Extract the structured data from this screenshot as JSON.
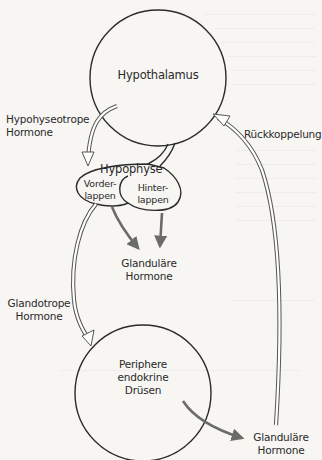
{
  "diagram": {
    "title": "",
    "nodes": {
      "hypothalamus": {
        "label": "Hypothalamus"
      },
      "hypophyse": {
        "label": "Hypophyse"
      },
      "vorderlappen": {
        "line1": "Vorder-",
        "line2": "lappen"
      },
      "hinterlappen": {
        "line1": "Hinter-",
        "line2": "lappen"
      },
      "periphere_druesen": {
        "line1": "Periphere",
        "line2": "endokrine",
        "line3": "Drüsen"
      }
    },
    "edge_labels": {
      "hypophyseotrope": {
        "line1": "Hypohyseotrope",
        "line2": "Hormone"
      },
      "rueckkoppelung": {
        "label": "Rückkoppelung"
      },
      "glanduläre_1": {
        "line1": "Glanduläre",
        "line2": "Hormone"
      },
      "glandotrope": {
        "line1": "Glandotrope",
        "line2": "Hormone"
      },
      "glanduläre_2": {
        "line1": "Glanduläre",
        "line2": "Hormone"
      }
    },
    "edges": [
      {
        "from": "hypothalamus",
        "to": "hypophyse",
        "style": "hollow-arrow",
        "label": "Hypohyseotrope Hormone"
      },
      {
        "from": "hypothalamus",
        "to": "hypophyse",
        "style": "stalk"
      },
      {
        "from": "vorderlappen",
        "to": "glanduläre_1",
        "style": "solid-gray-arrow"
      },
      {
        "from": "hinterlappen",
        "to": "glanduläre_1",
        "style": "solid-gray-arrow"
      },
      {
        "from": "vorderlappen",
        "to": "periphere_druesen",
        "style": "hollow-arrow",
        "label": "Glandotrope Hormone"
      },
      {
        "from": "periphere_druesen",
        "to": "glanduläre_2",
        "style": "solid-gray-arrow"
      },
      {
        "from": "glanduläre_2",
        "to": "hypothalamus",
        "style": "hollow-arrow",
        "label": "Rückkoppelung"
      }
    ],
    "colors": {
      "background": "#f7f6f3",
      "outline": "#2b2b2b",
      "solid_arrow": "#6b6b6b",
      "hollow_arrow_stroke": "#555555",
      "hollow_arrow_fill": "#ffffff",
      "text": "#2a2a2a"
    }
  }
}
